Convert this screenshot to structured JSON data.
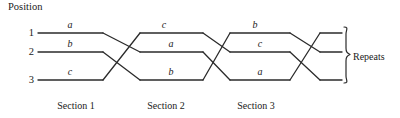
{
  "figure": {
    "title": "Position",
    "type": "permutation-braid-diagram",
    "stroke_color": "#2b2b2b",
    "background_color": "#ffffff"
  },
  "positions": [
    {
      "number": "1",
      "y": 33
    },
    {
      "number": "2",
      "y": 52
    },
    {
      "number": "3",
      "y": 80
    }
  ],
  "sections": [
    {
      "label": "Section 1",
      "letters": [
        "a",
        "b",
        "c"
      ]
    },
    {
      "label": "Section 2",
      "letters": [
        "c",
        "a",
        "b"
      ]
    },
    {
      "label": "Section 3",
      "letters": [
        "b",
        "c",
        "a"
      ]
    }
  ],
  "segment_labels": {
    "s1_row1": "a",
    "s1_row2": "b",
    "s1_row3": "c",
    "s2_row1": "c",
    "s2_row2": "a",
    "s2_row3": "b",
    "s3_row1": "b",
    "s3_row2": "c",
    "s3_row3": "a"
  },
  "annotation": {
    "brace_label": "Repeats"
  }
}
